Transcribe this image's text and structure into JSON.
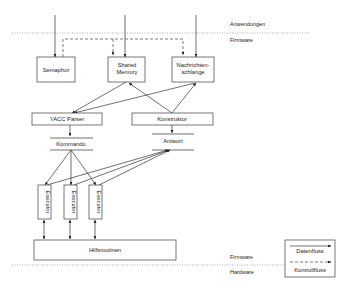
{
  "layers": {
    "top_above": "Anwendungen",
    "top_below": "Firmware",
    "bottom_above": "Firmware",
    "bottom_below": "Hardware"
  },
  "nodes": {
    "semaphor": "Semaphor",
    "shared_memory": [
      "Shared",
      "Memory"
    ],
    "nachrichtenschlange": [
      "Nachrichten-",
      "schlange"
    ],
    "yacc_parser": "YACC Parser",
    "konstruktor": "Konstruktor",
    "kommando": "Kommando",
    "antwort": "Antwort",
    "executors": [
      "Executor",
      "Executor",
      "Executor"
    ],
    "hilfsroutinen": "Hilfsroutinen"
  },
  "legend": {
    "data_flow": "Datenfluss",
    "control_flow": "Kontrollfluss"
  }
}
